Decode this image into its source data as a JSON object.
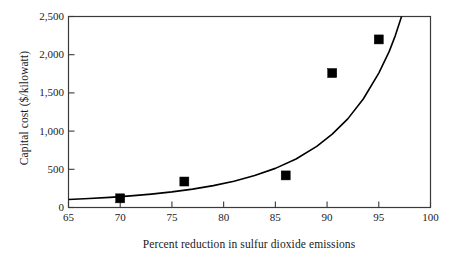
{
  "chart_data": {
    "type": "scatter",
    "title": "",
    "xlabel": "Percent reduction in sulfur dioxide emissions",
    "ylabel": "Capital cost ($/kilowatt)",
    "xlim": [
      65,
      100
    ],
    "ylim": [
      0,
      2500
    ],
    "xticks": [
      65,
      70,
      75,
      80,
      85,
      90,
      95,
      100
    ],
    "xtick_labels": [
      "65",
      "70",
      "75",
      "80",
      "85",
      "90",
      "95",
      "100"
    ],
    "yticks": [
      0,
      500,
      1000,
      1500,
      2000,
      2500
    ],
    "ytick_labels": [
      "0",
      "500",
      "1,000",
      "1,500",
      "2,000",
      "2,500"
    ],
    "grid": false,
    "legend": null,
    "marker_color": "#000000",
    "line_color": "#000000",
    "marker_style": "square",
    "series": [
      {
        "name": "Capital cost data",
        "type": "scatter",
        "points": [
          {
            "x": 70.0,
            "y": 120
          },
          {
            "x": 76.2,
            "y": 340
          },
          {
            "x": 86.0,
            "y": 420
          },
          {
            "x": 90.5,
            "y": 1760
          },
          {
            "x": 95.0,
            "y": 2200
          }
        ]
      },
      {
        "name": "Fitted exponential curve",
        "type": "line",
        "points": [
          {
            "x": 65.0,
            "y": 105
          },
          {
            "x": 67.0,
            "y": 118
          },
          {
            "x": 69.0,
            "y": 133
          },
          {
            "x": 71.0,
            "y": 152
          },
          {
            "x": 73.0,
            "y": 175
          },
          {
            "x": 75.0,
            "y": 204
          },
          {
            "x": 77.0,
            "y": 240
          },
          {
            "x": 79.0,
            "y": 286
          },
          {
            "x": 81.0,
            "y": 344
          },
          {
            "x": 83.0,
            "y": 418
          },
          {
            "x": 85.0,
            "y": 512
          },
          {
            "x": 87.0,
            "y": 635
          },
          {
            "x": 89.0,
            "y": 800
          },
          {
            "x": 90.5,
            "y": 960
          },
          {
            "x": 92.0,
            "y": 1160
          },
          {
            "x": 93.5,
            "y": 1420
          },
          {
            "x": 95.0,
            "y": 1760
          },
          {
            "x": 96.0,
            "y": 2040
          },
          {
            "x": 96.6,
            "y": 2250
          },
          {
            "x": 97.2,
            "y": 2500
          }
        ]
      }
    ]
  }
}
